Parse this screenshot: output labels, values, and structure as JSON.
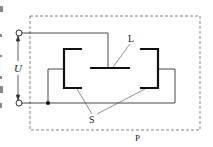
{
  "diagram": {
    "title": "",
    "labels": {
      "voltage": "U",
      "plate": "L",
      "electrodes": "S",
      "enclosure": "P"
    },
    "colors": {
      "line": "#333333",
      "thick": "#111111",
      "dashed": "#666666",
      "background": "#ffffff"
    },
    "components": [
      {
        "id": "terminal-top",
        "type": "terminal"
      },
      {
        "id": "terminal-bottom",
        "type": "terminal"
      },
      {
        "id": "plate-L",
        "type": "electrode-plate"
      },
      {
        "id": "electrode-S-left",
        "type": "bracket-electrode"
      },
      {
        "id": "electrode-S-right",
        "type": "bracket-electrode"
      },
      {
        "id": "enclosure-P",
        "type": "dashed-boundary"
      },
      {
        "id": "junction",
        "type": "junction-dot"
      }
    ]
  }
}
